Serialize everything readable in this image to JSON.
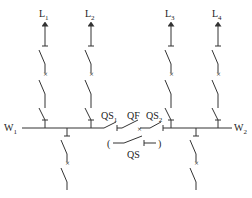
{
  "diagram": {
    "type": "single-busbar-sectionalized-with-bypass",
    "feeders_top": [
      {
        "id": "L1",
        "letter": "L",
        "sub": "1",
        "x": 45
      },
      {
        "id": "L2",
        "letter": "L",
        "sub": "2",
        "x": 91
      },
      {
        "id": "L3",
        "letter": "L",
        "sub": "3",
        "x": 171
      },
      {
        "id": "L4",
        "letter": "L",
        "sub": "4",
        "x": 218
      }
    ],
    "busbars": [
      {
        "id": "W1",
        "letter": "W",
        "sub": "1"
      },
      {
        "id": "W2",
        "letter": "W",
        "sub": "2"
      }
    ],
    "sectionalizer": {
      "qs1": {
        "letter": "QS",
        "sub": "1"
      },
      "qf": {
        "letter": "QF"
      },
      "qs2": {
        "letter": "QS",
        "sub": "2"
      },
      "bypass": {
        "letter": "QS",
        "open_paren": "(",
        "close_paren": ")"
      }
    },
    "line_color": "#333333",
    "background": "#ffffff"
  }
}
